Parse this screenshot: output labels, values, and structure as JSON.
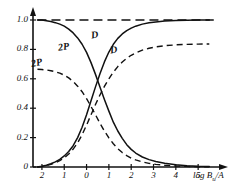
{
  "chart_data": {
    "type": "line",
    "title": "",
    "xlabel": "log Bu/A",
    "xlabel_main": "log B",
    "xlabel_sub": "u",
    "xlabel_tail": "/A",
    "ylabel": "",
    "xlim": [
      -2.4,
      5.8
    ],
    "ylim": [
      -0.02,
      1.06
    ],
    "grid": false,
    "legend": "inline-curve-labels",
    "xticks": [
      -2,
      -1,
      0,
      1,
      2,
      3,
      4,
      5
    ],
    "xticklabels": [
      "2",
      "1",
      "0",
      "1",
      "2",
      "3",
      "4",
      "5"
    ],
    "yticks": [
      0,
      0.2,
      0.4,
      0.6,
      0.8,
      1.0
    ],
    "yticklabels": [
      "0",
      "0.2",
      "0.4",
      "0.6",
      "0.8",
      "1.0"
    ],
    "reference_line": {
      "name": "unity-asymptote",
      "y": 1.0,
      "style": "dashed",
      "x_from": -2.2,
      "x_to": 5.7
    },
    "series": [
      {
        "name": "2P-solid-decreasing",
        "label": "2P",
        "style": "solid",
        "x": [
          -2.2,
          -2.0,
          -1.8,
          -1.6,
          -1.4,
          -1.2,
          -1.0,
          -0.8,
          -0.6,
          -0.4,
          -0.2,
          0.0,
          0.2,
          0.4,
          0.6,
          0.8,
          1.0,
          1.2,
          1.4,
          1.6,
          1.8,
          2.0,
          2.2,
          2.5,
          2.8,
          3.1,
          3.5,
          4.0,
          4.5,
          5.0,
          5.5
        ],
        "y": [
          1.0,
          1.0,
          0.995,
          0.99,
          0.982,
          0.972,
          0.958,
          0.938,
          0.912,
          0.878,
          0.835,
          0.78,
          0.71,
          0.63,
          0.545,
          0.46,
          0.38,
          0.305,
          0.245,
          0.195,
          0.152,
          0.12,
          0.095,
          0.068,
          0.05,
          0.037,
          0.025,
          0.015,
          0.009,
          0.005,
          0.003
        ]
      },
      {
        "name": "D-solid-increasing",
        "label": "D",
        "style": "solid",
        "x": [
          -2.2,
          -2.0,
          -1.8,
          -1.6,
          -1.4,
          -1.2,
          -1.0,
          -0.8,
          -0.6,
          -0.4,
          -0.2,
          0.0,
          0.2,
          0.4,
          0.6,
          0.8,
          1.0,
          1.2,
          1.4,
          1.6,
          1.8,
          2.0,
          2.2,
          2.5,
          2.8,
          3.1,
          3.5,
          4.0,
          4.5,
          5.0,
          5.5
        ],
        "y": [
          0.0,
          0.005,
          0.012,
          0.022,
          0.035,
          0.052,
          0.075,
          0.105,
          0.145,
          0.2,
          0.27,
          0.355,
          0.45,
          0.545,
          0.635,
          0.715,
          0.782,
          0.835,
          0.875,
          0.905,
          0.928,
          0.945,
          0.958,
          0.972,
          0.981,
          0.987,
          0.993,
          0.997,
          0.999,
          1.0,
          1.0
        ]
      },
      {
        "name": "2P-dashed-decreasing",
        "label": "2P",
        "style": "dashed",
        "x": [
          -2.2,
          -2.0,
          -1.8,
          -1.6,
          -1.4,
          -1.2,
          -1.0,
          -0.8,
          -0.6,
          -0.4,
          -0.2,
          0.0,
          0.2,
          0.4,
          0.6,
          0.8,
          1.0,
          1.2,
          1.4,
          1.6,
          1.8,
          2.0,
          2.2,
          2.5,
          2.8,
          3.1,
          3.5,
          4.0,
          4.5,
          5.0,
          5.5
        ],
        "y": [
          0.665,
          0.663,
          0.66,
          0.655,
          0.648,
          0.638,
          0.625,
          0.606,
          0.582,
          0.55,
          0.512,
          0.465,
          0.412,
          0.355,
          0.298,
          0.245,
          0.198,
          0.158,
          0.125,
          0.098,
          0.077,
          0.06,
          0.048,
          0.034,
          0.025,
          0.018,
          0.012,
          0.007,
          0.004,
          0.002,
          0.001
        ]
      },
      {
        "name": "D-dashed-increasing",
        "label": "D",
        "style": "dashed",
        "x": [
          -2.2,
          -2.0,
          -1.8,
          -1.6,
          -1.4,
          -1.2,
          -1.0,
          -0.8,
          -0.6,
          -0.4,
          -0.2,
          0.0,
          0.2,
          0.4,
          0.6,
          0.8,
          1.0,
          1.2,
          1.4,
          1.6,
          1.8,
          2.0,
          2.2,
          2.5,
          2.8,
          3.1,
          3.5,
          4.0,
          4.5,
          5.0,
          5.5
        ],
        "y": [
          0.0,
          0.004,
          0.01,
          0.018,
          0.029,
          0.043,
          0.062,
          0.088,
          0.122,
          0.165,
          0.22,
          0.285,
          0.355,
          0.425,
          0.49,
          0.548,
          0.6,
          0.645,
          0.683,
          0.714,
          0.74,
          0.76,
          0.776,
          0.795,
          0.808,
          0.817,
          0.825,
          0.831,
          0.834,
          0.836,
          0.837
        ]
      }
    ],
    "curve_annotations": [
      {
        "name": "label-2P-dashed",
        "text": "2P",
        "x_px": 31,
        "y_px": 57
      },
      {
        "name": "label-2P-solid",
        "text": "2P",
        "x_px": 58,
        "y_px": 41
      },
      {
        "name": "label-D-solid",
        "text": "D",
        "x_px": 91,
        "y_px": 29
      },
      {
        "name": "label-D-dashed",
        "text": "D",
        "x_px": 110,
        "y_px": 44
      }
    ]
  },
  "axes": {
    "x_tick_labels": [
      "2",
      "1",
      "0",
      "1",
      "2",
      "3",
      "4",
      "5"
    ],
    "y_tick_labels": [
      "1.0",
      "0.8",
      "0.6",
      "0.4",
      "0.2",
      "0"
    ],
    "x_axis_title": "log Bu/A"
  },
  "colors": {
    "ink": "#111111",
    "background": "#ffffff"
  }
}
